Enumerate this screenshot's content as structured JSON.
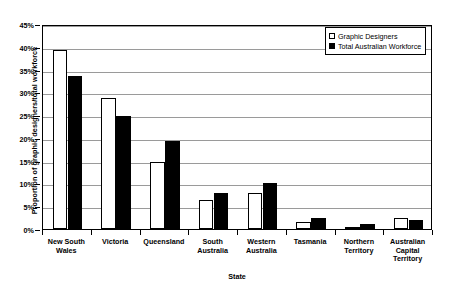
{
  "chart_data": {
    "type": "bar",
    "title": "",
    "xlabel": "State",
    "ylabel": "Proportion of graphic designers/total workforce",
    "categories": [
      "New South Wales",
      "Victoria",
      "Queensland",
      "South Australia",
      "Western Australia",
      "Tasmania",
      "Northern Territory",
      "Australian Capital Territory"
    ],
    "category_lines": [
      [
        "New South",
        "Wales"
      ],
      [
        "Victoria"
      ],
      [
        "Queensland"
      ],
      [
        "South",
        "Australia"
      ],
      [
        "Western",
        "Australia"
      ],
      [
        "Tasmania"
      ],
      [
        "Northern",
        "Territory"
      ],
      [
        "Australian",
        "Capital",
        "Territory"
      ]
    ],
    "series": [
      {
        "name": "Graphic Designers",
        "color": "#ffffff",
        "values": [
          39.3,
          28.8,
          14.7,
          6.3,
          7.8,
          1.5,
          0.4,
          2.4
        ]
      },
      {
        "name": "Total Australian Workforce",
        "color": "#000000",
        "values": [
          33.5,
          24.8,
          19.3,
          7.8,
          10.0,
          2.4,
          1.2,
          1.9
        ]
      }
    ],
    "ylim": [
      0,
      45
    ],
    "ytick_step": 5,
    "ytick_labels": [
      "0%",
      "5%",
      "10%",
      "15%",
      "20%",
      "25%",
      "30%",
      "35%",
      "40%",
      "45%"
    ],
    "ytick_values": [
      0,
      5,
      10,
      15,
      20,
      25,
      30,
      35,
      40,
      45
    ],
    "grid": true,
    "legend_position": "top-right"
  },
  "legend": {
    "items": [
      {
        "label": "Graphic Designers",
        "swatch": "light"
      },
      {
        "label": "Total Australian Workforce",
        "swatch": "dark"
      }
    ]
  },
  "axes": {
    "x_title": "State",
    "y_title": "Proportion of graphic designers/total workforce"
  }
}
